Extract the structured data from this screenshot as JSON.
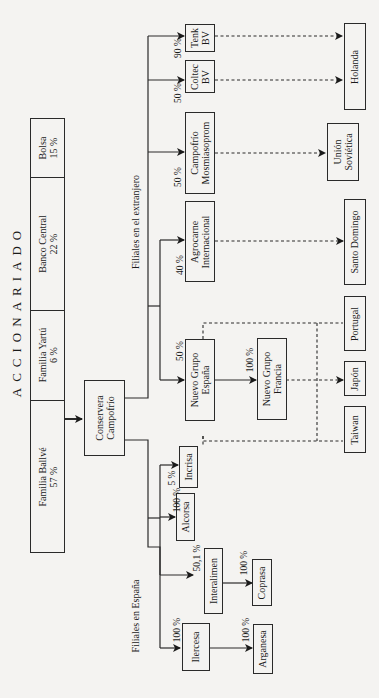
{
  "title": "ACCIONARIADO",
  "shareholders": [
    {
      "name": "Bolsa",
      "pct": "15 %"
    },
    {
      "name": "Banco Central",
      "pct": "22 %"
    },
    {
      "name": "Familia Yartú",
      "pct": "6 %"
    },
    {
      "name": "Familia Ballvé",
      "pct": "57 %"
    }
  ],
  "parent": {
    "line1": "Conservera",
    "line2": "Campofrío"
  },
  "groups": {
    "foreign": "Filiales en el extranjero",
    "spain": "Filiales en España"
  },
  "foreign_subsidiaries": [
    {
      "line1": "Tenk",
      "line2": "BV",
      "pct": "90 %",
      "country": "Holanda"
    },
    {
      "line1": "Coltec",
      "line2": "BV",
      "pct": "50 %",
      "country": "Holanda"
    },
    {
      "line1": "Campofrío",
      "line2": "Mosmiasoprom",
      "pct": "50 %",
      "country": "Unión Soviética"
    },
    {
      "line1": "Agrocarne",
      "line2": "Internacional",
      "pct": "40 %",
      "country": "Santo Domingo"
    },
    {
      "line1": "Nuevo Grupo",
      "line2": "España",
      "pct": "50 %",
      "countries": [
        "Portugal",
        "Japón",
        "Taiwan"
      ]
    }
  ],
  "second_level": [
    {
      "line1": "Nuevo Grupo",
      "line2": "Francia",
      "pct": "100 %",
      "parent": "Nuevo Grupo España"
    }
  ],
  "countries": {
    "holanda": {
      "line1": "Holanda",
      "line2": ""
    },
    "union_sovietica": {
      "line1": "Unión",
      "line2": "Soviética"
    },
    "santo_domingo": {
      "line1": "Santo Domingo",
      "line2": ""
    },
    "portugal": {
      "line1": "Portugal",
      "line2": ""
    },
    "japon": {
      "line1": "Japón",
      "line2": ""
    },
    "taiwan": {
      "line1": "Taiwan",
      "line2": ""
    }
  },
  "spain_subsidiaries": [
    {
      "name": "Incrisa",
      "pct": "5 %"
    },
    {
      "name": "Alcorsa",
      "pct": "100 %"
    },
    {
      "name": "Interalimen",
      "pct": "50,1 %",
      "child": {
        "name": "Coprasa",
        "pct": "100 %"
      }
    },
    {
      "name": "Ilercesa",
      "pct": "100 %",
      "child": {
        "name": "Arganesa",
        "pct": "100 %"
      }
    }
  ]
}
